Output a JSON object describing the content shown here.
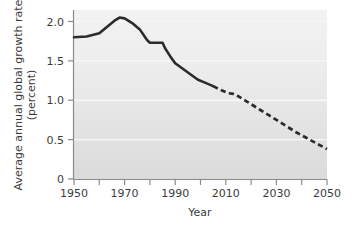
{
  "chart_data": {
    "type": "line",
    "title": "",
    "xlabel": "Year",
    "ylabel": "Average annual global growth rate (percent)",
    "ylabel_line1": "Average annual global growth rate",
    "ylabel_line2": "(percent)",
    "xlim": [
      1950,
      2050
    ],
    "ylim": [
      0,
      2.15
    ],
    "grid": "horizontal-white-faint",
    "legend": "none",
    "x_ticks_major": [
      1950,
      1970,
      1990,
      2010,
      2030,
      2050
    ],
    "x_tick_labels": [
      "1950",
      "1970",
      "1990",
      "2010",
      "2030",
      "2050"
    ],
    "x_ticks_minor": [
      1960,
      1980,
      2000,
      2020,
      2040
    ],
    "y_ticks": [
      0,
      0.5,
      1.0,
      1.5,
      2.0
    ],
    "y_tick_labels": [
      "0",
      "0.5",
      "1.0",
      "1.5",
      "2.0"
    ],
    "series": [
      {
        "name": "Observed growth rate",
        "style": "solid",
        "color": "#2b2b2b",
        "x": [
          1950,
          1955,
          1960,
          1963,
          1966,
          1968,
          1970,
          1973,
          1976,
          1979,
          1980,
          1982,
          1985,
          1986,
          1988,
          1990,
          1993,
          1996,
          1999,
          2002,
          2005
        ],
        "values": [
          1.8,
          1.81,
          1.85,
          1.93,
          2.01,
          2.05,
          2.04,
          1.98,
          1.9,
          1.76,
          1.73,
          1.73,
          1.73,
          1.66,
          1.56,
          1.47,
          1.4,
          1.33,
          1.26,
          1.22,
          1.18
        ]
      },
      {
        "name": "Projected growth rate",
        "style": "dashed",
        "color": "#2b2b2b",
        "x": [
          2005,
          2008,
          2011,
          2013,
          2015,
          2018,
          2021,
          2024,
          2027,
          2030,
          2034,
          2038,
          2042,
          2046,
          2050
        ],
        "values": [
          1.18,
          1.13,
          1.09,
          1.08,
          1.05,
          0.99,
          0.93,
          0.87,
          0.81,
          0.75,
          0.67,
          0.59,
          0.52,
          0.45,
          0.38
        ]
      }
    ],
    "plot_background": {
      "top_color": "#f2f2f2",
      "bottom_color": "#dcdcdc",
      "gridline_color": "#f7f7f7"
    },
    "axis_color": "#8a8a8a"
  }
}
